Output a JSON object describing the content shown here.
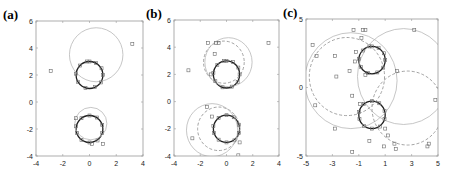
{
  "figure": {
    "panels": [
      "(a)",
      "(b)",
      "(c)"
    ]
  },
  "chart_data": [
    {
      "type": "scatter",
      "label": "(a)",
      "title": "",
      "xlabel": "",
      "ylabel": "",
      "xlim": [
        -4,
        4
      ],
      "ylim": [
        -4,
        6
      ],
      "xticks": [
        -4,
        -2,
        0,
        2,
        4
      ],
      "yticks": [
        -4,
        -2,
        0,
        2,
        4,
        6
      ],
      "grid": false,
      "box": {
        "x0": 36,
        "y0": 21,
        "x1": 143,
        "y1": 156
      },
      "circles": [
        {
          "cx": 0,
          "cy": 2,
          "r": 1,
          "style": "solid-dark"
        },
        {
          "cx": 0,
          "cy": -2,
          "r": 1,
          "style": "solid-dark"
        },
        {
          "cx": 0.5,
          "cy": 3.5,
          "r": 2.0,
          "style": "solid-light"
        },
        {
          "cx": 0.1,
          "cy": -1.6,
          "r": 1.2,
          "style": "solid-light"
        }
      ],
      "points": [
        [
          3.2,
          4.3
        ],
        [
          -2.9,
          2.3
        ],
        [
          -1.0,
          -1.2
        ],
        [
          1.0,
          -3.1
        ],
        [
          0.2,
          -3.1
        ],
        [
          0,
          3
        ],
        [
          0.5,
          2.9
        ],
        [
          0.9,
          2.5
        ],
        [
          1.0,
          2.0
        ],
        [
          0.85,
          1.45
        ],
        [
          0.4,
          1.1
        ],
        [
          -0.3,
          1.05
        ],
        [
          -0.85,
          1.5
        ],
        [
          -1.0,
          2.1
        ],
        [
          -0.7,
          2.7
        ],
        [
          -0.2,
          3.0
        ],
        [
          0,
          -1
        ],
        [
          0.55,
          -1.15
        ],
        [
          0.95,
          -1.7
        ],
        [
          0.95,
          -2.3
        ],
        [
          0.6,
          -2.85
        ],
        [
          0,
          -3.0
        ],
        [
          -0.6,
          -2.8
        ],
        [
          -0.95,
          -2.3
        ],
        [
          -1.0,
          -1.8
        ],
        [
          -0.6,
          -1.2
        ]
      ]
    },
    {
      "type": "scatter",
      "label": "(b)",
      "title": "",
      "xlabel": "",
      "ylabel": "",
      "xlim": [
        -4,
        4
      ],
      "ylim": [
        -4,
        6
      ],
      "xticks": [
        -4,
        -2,
        0,
        2,
        4
      ],
      "yticks": [
        -4,
        -2,
        0,
        2,
        4,
        6
      ],
      "grid": false,
      "box": {
        "x0": 174,
        "y0": 20,
        "x1": 279,
        "y1": 156
      },
      "circles": [
        {
          "cx": 0,
          "cy": 2,
          "r": 1,
          "style": "solid-dark"
        },
        {
          "cx": 0,
          "cy": -2,
          "r": 1,
          "style": "solid-dark"
        },
        {
          "cx": -0.2,
          "cy": 2.9,
          "r": 1.55,
          "style": "dashed"
        },
        {
          "cx": 0.15,
          "cy": 2.9,
          "r": 1.8,
          "style": "solid-light"
        },
        {
          "cx": -0.6,
          "cy": -2.0,
          "r": 1.6,
          "style": "dashed"
        },
        {
          "cx": -1.1,
          "cy": -2.1,
          "r": 1.95,
          "style": "solid-light"
        }
      ],
      "points": [
        [
          3.2,
          4.3
        ],
        [
          -2.9,
          2.3
        ],
        [
          -1.4,
          4.3
        ],
        [
          -0.8,
          4.3
        ],
        [
          -0.6,
          4.3
        ],
        [
          -0.9,
          3.5
        ],
        [
          -1.2,
          2.0
        ],
        [
          -1.5,
          -0.4
        ],
        [
          -1.1,
          -1.1
        ],
        [
          -2.6,
          -2.7
        ],
        [
          1.0,
          -3.0
        ],
        [
          0.9,
          -3.95
        ],
        [
          0,
          3
        ],
        [
          0.5,
          2.9
        ],
        [
          0.9,
          2.5
        ],
        [
          1.0,
          2.0
        ],
        [
          0.85,
          1.45
        ],
        [
          0.4,
          1.1
        ],
        [
          -0.3,
          1.05
        ],
        [
          -0.85,
          1.5
        ],
        [
          -1.0,
          2.1
        ],
        [
          -0.7,
          2.7
        ],
        [
          -0.2,
          3.0
        ],
        [
          0,
          -1
        ],
        [
          0.55,
          -1.15
        ],
        [
          0.95,
          -1.7
        ],
        [
          0.95,
          -2.3
        ],
        [
          0.6,
          -2.85
        ],
        [
          0,
          -3.0
        ],
        [
          -0.6,
          -2.8
        ],
        [
          -0.95,
          -2.3
        ],
        [
          -1.0,
          -1.8
        ],
        [
          -0.6,
          -1.2
        ]
      ]
    },
    {
      "type": "scatter",
      "label": "(c)",
      "title": "",
      "xlabel": "",
      "ylabel": "",
      "xlim": [
        -5,
        5
      ],
      "ylim": [
        -5,
        5
      ],
      "xticks": [
        -5,
        -3,
        -1,
        1,
        3,
        5
      ],
      "yticks": [
        -5,
        0,
        5
      ],
      "grid": false,
      "box": {
        "x0": 306,
        "y0": 19,
        "x1": 438,
        "y1": 156
      },
      "circles": [
        {
          "cx": 0,
          "cy": 2,
          "r": 1,
          "style": "solid-dark"
        },
        {
          "cx": 0,
          "cy": -2,
          "r": 1,
          "style": "solid-dark"
        },
        {
          "cx": -1.9,
          "cy": 0.8,
          "r": 2.85,
          "style": "dashed"
        },
        {
          "cx": -1.6,
          "cy": 0.5,
          "r": 3.5,
          "style": "solid-light"
        },
        {
          "cx": 2.4,
          "cy": 0.8,
          "r": 3.5,
          "style": "solid-light"
        },
        {
          "cx": 2.7,
          "cy": -1.5,
          "r": 2.7,
          "style": "dashed"
        }
      ],
      "points": [
        [
          -1.4,
          4.2
        ],
        [
          -0.7,
          4.2
        ],
        [
          -0.5,
          4.2
        ],
        [
          3.2,
          4.2
        ],
        [
          -4.5,
          3.1
        ],
        [
          -0.8,
          3.6
        ],
        [
          -2.8,
          2.3
        ],
        [
          -4.2,
          2.3
        ],
        [
          -1.2,
          2.6
        ],
        [
          -1.3,
          1.9
        ],
        [
          -1.7,
          1.2
        ],
        [
          -2.7,
          0.8
        ],
        [
          1.9,
          1.2
        ],
        [
          -0.5,
          0.9
        ],
        [
          -1.5,
          -0.6
        ],
        [
          -4.3,
          -1.3
        ],
        [
          4.8,
          -0.9
        ],
        [
          -0.9,
          -1.2
        ],
        [
          -2.8,
          -3.0
        ],
        [
          1.0,
          -3.0
        ],
        [
          1.2,
          -3.5
        ],
        [
          1.7,
          -4.1
        ],
        [
          0.9,
          -4.3
        ],
        [
          1.8,
          -4.5
        ],
        [
          4.3,
          -4.1
        ],
        [
          4.2,
          -4.3
        ],
        [
          -1.5,
          -4.7
        ],
        [
          -0.2,
          -3.9
        ],
        [
          0,
          3
        ],
        [
          0.5,
          2.9
        ],
        [
          0.9,
          2.5
        ],
        [
          1.0,
          2.0
        ],
        [
          0.85,
          1.45
        ],
        [
          0.4,
          1.1
        ],
        [
          -0.3,
          1.05
        ],
        [
          -0.85,
          1.5
        ],
        [
          -1.0,
          2.1
        ],
        [
          -0.7,
          2.7
        ],
        [
          -0.2,
          3.0
        ],
        [
          0,
          -1
        ],
        [
          0.55,
          -1.15
        ],
        [
          0.95,
          -1.7
        ],
        [
          0.95,
          -2.3
        ],
        [
          0.6,
          -2.85
        ],
        [
          0,
          -3.0
        ],
        [
          -0.6,
          -2.8
        ],
        [
          -0.95,
          -2.3
        ],
        [
          -1.0,
          -1.8
        ],
        [
          -0.6,
          -1.2
        ]
      ]
    }
  ],
  "colors": {
    "axis": "#9a9a9a",
    "solid_dark": "#1e1e1e",
    "solid_light": "#b8b8b8",
    "dashed": "#8c8c8c",
    "marker": "#6a6a6a"
  }
}
